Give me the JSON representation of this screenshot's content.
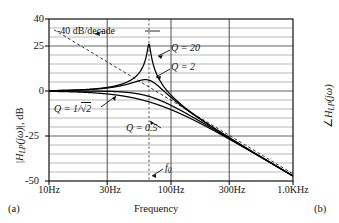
{
  "figure": {
    "panel_a_label": "(a)",
    "panel_b_label": "(b)",
    "y_axis_label_left": "|H_LP(jω)|, dB",
    "y_axis_label_right": "∠H_LP(jω)",
    "x_axis_label": "Frequency"
  },
  "chart_data": {
    "type": "line",
    "title": "",
    "xlabel": "Frequency",
    "ylabel": "|H_LP(jω)|, dB",
    "xscale": "log",
    "xlim": [
      10,
      1000
    ],
    "ylim": [
      -50,
      40
    ],
    "grid": true,
    "grid_y_step": 5,
    "x_ticks": [
      10,
      30,
      100,
      300,
      1000
    ],
    "x_tick_labels": [
      "10Hz",
      "30Hz",
      "100Hz",
      "300Hz",
      "1.0KHz"
    ],
    "y_ticks": [
      40,
      25,
      0,
      -25,
      -50
    ],
    "y_tick_labels": [
      "40",
      "25",
      "0",
      "-25",
      "-50"
    ],
    "f0_hz": 66,
    "f0_label": "f₀",
    "asymptote": {
      "label": "-40 dB/decade",
      "slope_db_per_decade": -40,
      "style": "dashed",
      "points": [
        [
          11,
          34
        ],
        [
          1000,
          -46
        ]
      ]
    },
    "series": [
      {
        "name": "Q = 20",
        "label": "Q = 20",
        "Q": 20,
        "peak_db": 26,
        "peak_hz": 66,
        "points": [
          [
            10,
            0.1
          ],
          [
            15,
            0.3
          ],
          [
            20,
            0.6
          ],
          [
            30,
            1.5
          ],
          [
            40,
            3.0
          ],
          [
            50,
            6.0
          ],
          [
            58,
            11.0
          ],
          [
            63,
            19.0
          ],
          [
            66,
            26.0
          ],
          [
            69,
            18.0
          ],
          [
            75,
            8.5
          ],
          [
            85,
            1.0
          ],
          [
            100,
            -7.5
          ],
          [
            150,
            -21.0
          ],
          [
            200,
            -29.0
          ],
          [
            300,
            -38.5
          ],
          [
            500,
            -49.0
          ],
          [
            700,
            -56.0
          ],
          [
            1000,
            -62.0
          ]
        ]
      },
      {
        "name": "Q = 2",
        "label": "Q = 2",
        "Q": 2,
        "peak_db": 6.3,
        "peak_hz": 64,
        "points": [
          [
            10,
            0.1
          ],
          [
            15,
            0.2
          ],
          [
            20,
            0.4
          ],
          [
            30,
            1.0
          ],
          [
            40,
            2.0
          ],
          [
            50,
            3.6
          ],
          [
            58,
            5.2
          ],
          [
            64,
            6.3
          ],
          [
            70,
            5.6
          ],
          [
            80,
            2.8
          ],
          [
            100,
            -2.5
          ],
          [
            150,
            -15.0
          ],
          [
            200,
            -22.0
          ],
          [
            300,
            -33.0
          ],
          [
            500,
            -45.0
          ],
          [
            700,
            -53.0
          ],
          [
            1000,
            -60.0
          ]
        ]
      },
      {
        "name": "Q = 1/√2",
        "label": "Q = 1/√2",
        "Q": 0.707,
        "peak_db": 0,
        "peak_hz": 66,
        "points": [
          [
            10,
            0.0
          ],
          [
            20,
            0.0
          ],
          [
            30,
            -0.1
          ],
          [
            40,
            -0.2
          ],
          [
            50,
            -0.6
          ],
          [
            60,
            -1.8
          ],
          [
            66,
            -3.0
          ],
          [
            80,
            -6.2
          ],
          [
            100,
            -10.5
          ],
          [
            150,
            -19.5
          ],
          [
            200,
            -25.5
          ],
          [
            300,
            -34.5
          ],
          [
            500,
            -46.0
          ],
          [
            700,
            -53.5
          ],
          [
            1000,
            -60.5
          ]
        ]
      },
      {
        "name": "Q = 0.5",
        "label": "Q = 0.5",
        "Q": 0.5,
        "peak_db": 0,
        "peak_hz": 0,
        "points": [
          [
            10,
            -0.1
          ],
          [
            20,
            -0.3
          ],
          [
            30,
            -0.8
          ],
          [
            40,
            -1.6
          ],
          [
            50,
            -2.8
          ],
          [
            60,
            -4.2
          ],
          [
            66,
            -6.0
          ],
          [
            80,
            -8.6
          ],
          [
            100,
            -12.5
          ],
          [
            150,
            -21.0
          ],
          [
            200,
            -26.5
          ],
          [
            300,
            -35.5
          ],
          [
            500,
            -46.5
          ],
          [
            700,
            -54.0
          ],
          [
            1000,
            -61.0
          ]
        ]
      }
    ],
    "annotations": [
      {
        "text": "-40 dB/decade",
        "x_px": 57,
        "y_px": 30
      },
      {
        "text": "Q = 20",
        "x_px": 172,
        "y_px": 47
      },
      {
        "text": "Q = 2",
        "x_px": 172,
        "y_px": 66
      },
      {
        "text": "Q = 1/√2",
        "x_px": 63,
        "y_px": 111
      },
      {
        "text": "Q = 0.5",
        "x_px": 118,
        "y_px": 128
      },
      {
        "text": "f₀",
        "x_px": 164,
        "y_px": 167
      }
    ]
  }
}
